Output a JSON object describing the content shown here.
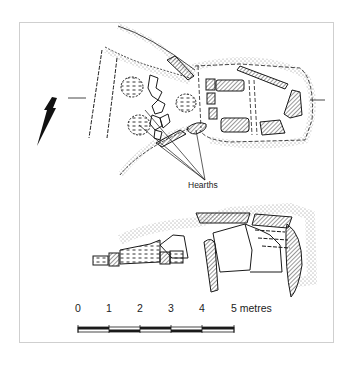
{
  "figure": {
    "type": "archaeological-plan-and-elevation",
    "annotations": {
      "hearths_label": "Hearths"
    },
    "north_arrow": {
      "direction": "south-south-west",
      "icon": "north-arrow-icon"
    },
    "scale_bar": {
      "ticks": [
        "0",
        "1",
        "2",
        "3",
        "4",
        "5"
      ],
      "unit": "metres",
      "last_label": "5 metres"
    },
    "colors": {
      "ink": "#1a1a1a",
      "frame": "#cfcfcf",
      "background": "#ffffff"
    }
  }
}
